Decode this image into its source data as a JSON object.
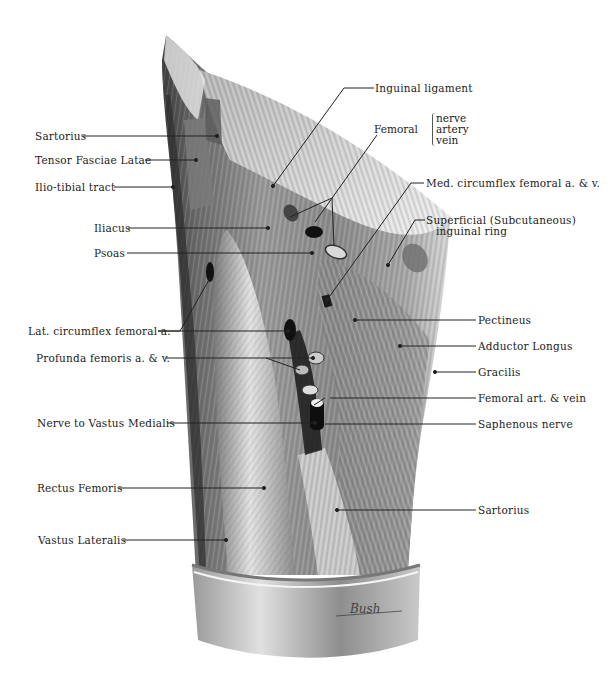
{
  "figure": {
    "signature": "Bush"
  },
  "labels_left": [
    {
      "id": "sartorius-top",
      "text": "Sartorius"
    },
    {
      "id": "tensor-fasciae-latae",
      "text": "Tensor Fasciae Latae"
    },
    {
      "id": "ilio-tibial-tract",
      "text": "Ilio-tibial tract"
    },
    {
      "id": "iliacus",
      "text": "Iliacus"
    },
    {
      "id": "psoas",
      "text": "Psoas"
    },
    {
      "id": "lat-circumflex",
      "text": "Lat. circumflex femoral a."
    },
    {
      "id": "profunda-femoris",
      "text": "Profunda femoris a. & v."
    },
    {
      "id": "nerve-vastus-medialis",
      "text": "Nerve to Vastus Medialis"
    },
    {
      "id": "rectus-femoris",
      "text": "Rectus Femoris"
    },
    {
      "id": "vastus-lateralis",
      "text": "Vastus Lateralis"
    }
  ],
  "labels_right": [
    {
      "id": "inguinal-ligament",
      "text": "Inguinal ligament"
    },
    {
      "id": "med-circumflex",
      "text": "Med. circumflex femoral a. & v."
    },
    {
      "id": "superficial-ring-1",
      "text": "Superficial (Subcutaneous)"
    },
    {
      "id": "superficial-ring-2",
      "text": "inguinal ring"
    },
    {
      "id": "pectineus",
      "text": "Pectineus"
    },
    {
      "id": "adductor-longus",
      "text": "Adductor Longus"
    },
    {
      "id": "gracilis",
      "text": "Gracilis"
    },
    {
      "id": "femoral-art-vein",
      "text": "Femoral art. & vein"
    },
    {
      "id": "saphenous-nerve",
      "text": "Saphenous nerve"
    },
    {
      "id": "sartorius-bottom",
      "text": "Sartorius"
    }
  ],
  "femoral_group": {
    "label": "Femoral",
    "items": [
      "nerve",
      "artery",
      "vein"
    ]
  }
}
